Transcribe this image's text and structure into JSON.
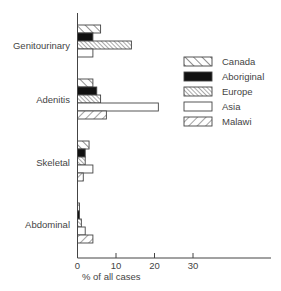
{
  "chart_data": {
    "type": "bar",
    "orientation": "horizontal",
    "title": "",
    "xlabel": "% of all cases",
    "ylabel": "",
    "xlim": [
      0,
      50
    ],
    "xticks": [
      0,
      10,
      20,
      30
    ],
    "grid": false,
    "legend_position": "right-top",
    "categories": [
      "Genitourinary",
      "Adenitis",
      "Skeletal",
      "Abdominal"
    ],
    "series": [
      {
        "name": "Canada",
        "pattern": "wide-back-diagonal",
        "values": [
          6,
          4,
          3,
          0.5
        ]
      },
      {
        "name": "Aboriginal",
        "pattern": "solid-black",
        "values": [
          4,
          5,
          2,
          0.5
        ]
      },
      {
        "name": "Europe",
        "pattern": "dense-back-diagonal",
        "values": [
          14,
          6,
          2,
          1
        ]
      },
      {
        "name": "Asia",
        "pattern": "white",
        "values": [
          4,
          21,
          4,
          2
        ]
      },
      {
        "name": "Malawi",
        "pattern": "forward-diagonal",
        "values": [
          0,
          7.5,
          1.5,
          4
        ]
      }
    ]
  }
}
